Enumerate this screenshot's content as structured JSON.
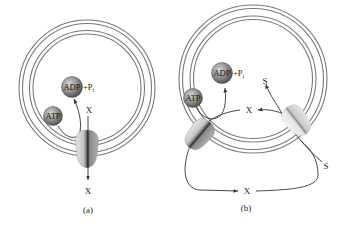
{
  "figure": {
    "panels": [
      {
        "id": "a",
        "caption": "(a)",
        "molecules": {
          "atp": "ATP",
          "adp": "ADP",
          "phosphate": "+P",
          "phosphate_sub": "i"
        },
        "substrate_inside": "X",
        "substrate_outside": "X"
      },
      {
        "id": "b",
        "caption": "(b)",
        "molecules": {
          "atp": "ATP",
          "adp": "ADP",
          "phosphate": "+P",
          "phosphate_sub": "i"
        },
        "substrate_inside": "X",
        "substrate_outside": "X",
        "cotransport_inside": "S",
        "cotransport_outside": "S"
      }
    ]
  },
  "colors": {
    "membrane": "#7a7a7a",
    "membrane_fill": "#ffffff",
    "molecule_sphere": "#8a8a8a",
    "pump_body": "#b8b8b8",
    "pump_channel": "#3a3a3a",
    "arrow": "#333333"
  }
}
